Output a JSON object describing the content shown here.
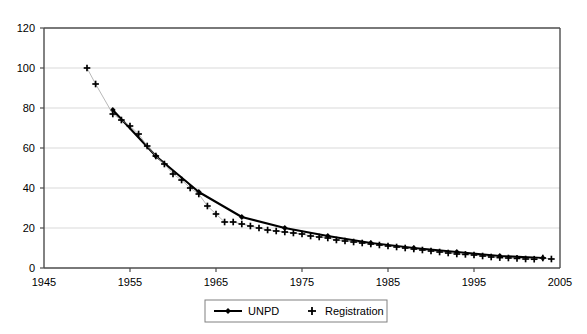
{
  "chart_data": {
    "type": "line",
    "title": "",
    "subtitle": "",
    "xlabel": "",
    "ylabel": "",
    "xlim": [
      1945,
      2005
    ],
    "ylim": [
      0,
      120
    ],
    "xticks": [
      1945,
      1955,
      1965,
      1975,
      1985,
      1995,
      2005
    ],
    "yticks": [
      0,
      20,
      40,
      60,
      80,
      100,
      120
    ],
    "grid": "horizontal",
    "legend_position": "bottom",
    "legend": [
      "UNPD",
      "Registration"
    ],
    "series": [
      {
        "name": "UNPD",
        "marker": "diamond",
        "line": "solid",
        "color": "#000000",
        "x": [
          1953,
          1958,
          1963,
          1968,
          1973,
          1978,
          1983,
          1988,
          1993,
          1998,
          2003
        ],
        "values": [
          79,
          56,
          38,
          25.5,
          20,
          16,
          12.5,
          10,
          8,
          6,
          5
        ]
      },
      {
        "name": "Registration",
        "marker": "plus",
        "line": "none",
        "color": "#000000",
        "x": [
          1950,
          1951,
          1953,
          1954,
          1955,
          1956,
          1957,
          1958,
          1959,
          1960,
          1961,
          1962,
          1963,
          1964,
          1965,
          1966,
          1967,
          1968,
          1969,
          1970,
          1971,
          1972,
          1973,
          1974,
          1975,
          1976,
          1977,
          1978,
          1979,
          1980,
          1981,
          1982,
          1983,
          1984,
          1985,
          1986,
          1987,
          1988,
          1989,
          1990,
          1991,
          1992,
          1993,
          1994,
          1995,
          1996,
          1997,
          1998,
          1999,
          2000,
          2001,
          2002,
          2003,
          2004
        ],
        "values": [
          100,
          92,
          77,
          74,
          71,
          67,
          61,
          56,
          52,
          47,
          44,
          40,
          37,
          31,
          27,
          23,
          23,
          22,
          21,
          20,
          19,
          18.5,
          18,
          17.5,
          17,
          16,
          15.5,
          15,
          14,
          13.5,
          13,
          12.5,
          12,
          11.5,
          11,
          10.5,
          10,
          9.5,
          9,
          8.5,
          8,
          7.5,
          7,
          6.8,
          6.5,
          6,
          5.5,
          5.2,
          5,
          4.8,
          4.5,
          4.4,
          5,
          4.5
        ]
      }
    ]
  },
  "axes": {
    "x_tick_labels": [
      "1945",
      "1955",
      "1965",
      "1975",
      "1985",
      "1995",
      "2005"
    ],
    "y_tick_labels": [
      "0",
      "20",
      "40",
      "60",
      "80",
      "100",
      "120"
    ]
  },
  "legend": {
    "items": [
      {
        "label": "UNPD",
        "marker": "line-diamond"
      },
      {
        "label": "Registration",
        "marker": "plus"
      }
    ]
  },
  "colors": {
    "series": "#000000",
    "grid": "#d9d9d9",
    "border": "#4d4d4d",
    "background": "#ffffff"
  }
}
